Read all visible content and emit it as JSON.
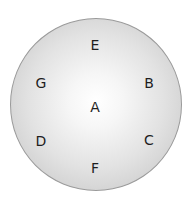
{
  "diagram": {
    "shape": "circle",
    "fill_center": "#ffffff",
    "fill_edge": "#bdbdbd",
    "border_color": "#9a9a9a",
    "text_color": "#1e1e1e",
    "labels": [
      {
        "id": "E",
        "text": "E",
        "position": "top"
      },
      {
        "id": "G",
        "text": "G",
        "position": "upper-left"
      },
      {
        "id": "B",
        "text": "B",
        "position": "upper-right"
      },
      {
        "id": "A",
        "text": "A",
        "position": "center"
      },
      {
        "id": "D",
        "text": "D",
        "position": "lower-left"
      },
      {
        "id": "C",
        "text": "C",
        "position": "lower-right"
      },
      {
        "id": "F",
        "text": "F",
        "position": "bottom"
      }
    ]
  }
}
